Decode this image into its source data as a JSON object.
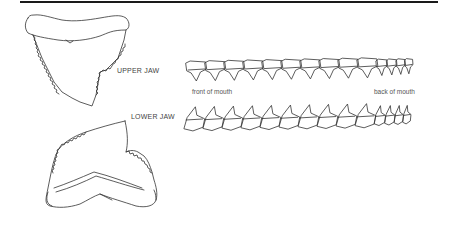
{
  "diagram": {
    "labels": {
      "upper_jaw": "UPPER JAW",
      "lower_jaw": "LOWER JAW",
      "front_of_mouth": "front of mouth",
      "back_of_mouth": "back of mouth"
    },
    "upper_row": {
      "tooth_count": 14
    },
    "lower_row": {
      "tooth_count": 14
    }
  }
}
